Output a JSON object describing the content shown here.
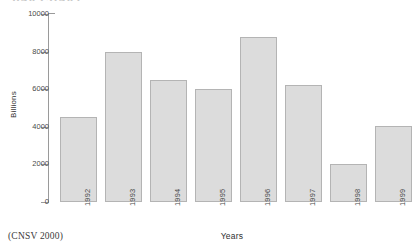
{
  "chart_data": {
    "type": "bar",
    "title": "BAR CHART",
    "subtitle": "",
    "categories": [
      "1992",
      "1993",
      "1994",
      "1995",
      "1996",
      "1997",
      "1998",
      "1999"
    ],
    "values": [
      4500,
      8000,
      6500,
      6000,
      8800,
      6250,
      2000,
      4050
    ],
    "series": [
      {
        "name": "Billions",
        "values": [
          4500,
          8000,
          6500,
          6000,
          8800,
          6250,
          2000,
          4050
        ]
      }
    ],
    "xlabel": "Years",
    "ylabel": "Billions",
    "ylim": [
      0,
      10000
    ],
    "yticks": [
      0,
      2000,
      4000,
      6000,
      8000,
      10000
    ],
    "ytick_labels": [
      "0",
      "2000",
      "4000",
      "6000",
      "8000",
      "10000"
    ],
    "grid": false,
    "legend": false,
    "legend_position": "none",
    "xtick_rotation": -90,
    "bar_fill_color": "#dcdcdc",
    "bar_border_color": "#b4b4b4",
    "axis_color": "#9a9a9a",
    "background_color": "#ffffff",
    "annotations": []
  },
  "footer": {
    "source_note": "(CNSV 2000)"
  }
}
